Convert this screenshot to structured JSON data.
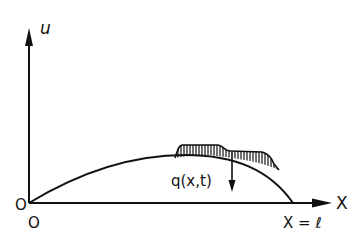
{
  "diagram": {
    "axes": {
      "vertical_label": "u",
      "horizontal_label": "X",
      "origin_label_left": "O",
      "origin_label_bottom": "O",
      "end_label": "X = ℓ"
    },
    "load": {
      "label": "q(x,t)",
      "description": "distributed hatched load acting downward on deflected string/beam"
    },
    "curve": {
      "description": "deflection curve u(x) from origin to x = ℓ"
    },
    "colors": {
      "line": "#111111",
      "background": "#ffffff"
    }
  }
}
